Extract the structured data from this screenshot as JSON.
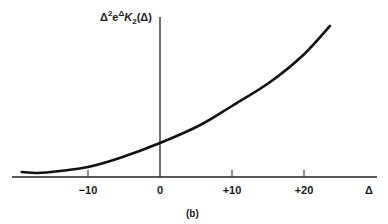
{
  "chart_data": {
    "type": "line",
    "title": "",
    "caption": "(b)",
    "xlabel": "Δ",
    "ylabel": "Δ²e^Δ K₂(Δ)",
    "ylabel_parts": {
      "base": "Δ",
      "sup1": "2",
      "mid": "e",
      "sup2": "Δ",
      "func": "K",
      "sub": "2",
      "arg": "(Δ)"
    },
    "xlim": [
      -20.5,
      30
    ],
    "ylim": [
      0,
      160
    ],
    "grid": false,
    "legend": null,
    "x_ticks": [
      {
        "value": -10,
        "label": "−10"
      },
      {
        "value": 0,
        "label": "0"
      },
      {
        "value": 10,
        "label": "+10"
      },
      {
        "value": 20,
        "label": "+20"
      }
    ],
    "series": [
      {
        "name": "Δ²e^Δ K₂(Δ)",
        "x": [
          -19.2,
          -17.0,
          -13.9,
          -10.0,
          -5.6,
          0.0,
          5.6,
          10.0,
          15.3,
          19.9,
          23.6
        ],
        "y": [
          5,
          4,
          6,
          10,
          19,
          34,
          52,
          71,
          95,
          122,
          151
        ]
      }
    ]
  }
}
